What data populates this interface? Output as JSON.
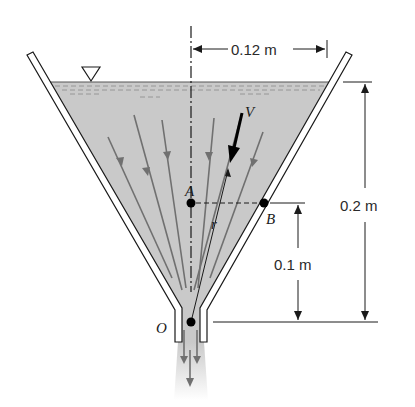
{
  "figure": {
    "type": "funnel-flow-diagram",
    "colors": {
      "fluid": "#c9c9c9",
      "wall_stroke": "#1a1a1a",
      "streamline": "#707070",
      "velocity_vector": "#000000",
      "background": "#ffffff"
    },
    "labels": {
      "free_surface_symbol": "▽",
      "velocity": "V",
      "radius": "r",
      "point_a": "A",
      "point_b": "B",
      "point_o": "O"
    },
    "dimensions": {
      "horizontal_radius": "0.12 m",
      "total_height": "0.2 m",
      "height_ab": "0.1 m"
    }
  }
}
